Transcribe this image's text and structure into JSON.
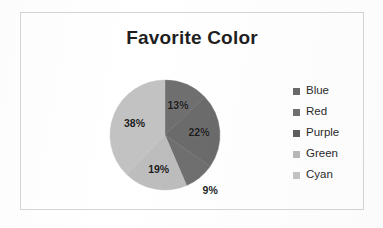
{
  "chart_data": {
    "type": "pie",
    "title": "Favorite Color",
    "categories": [
      "Blue",
      "Red",
      "Purple",
      "Green",
      "Cyan"
    ],
    "values": [
      13,
      22,
      9,
      19,
      38
    ],
    "value_labels": [
      "13%",
      "22%",
      "9%",
      "19%",
      "38%"
    ],
    "label_placement": [
      "inside",
      "inside",
      "outside",
      "inside",
      "inside"
    ],
    "slice_colors": [
      "#6f6f6f",
      "#6b6b6b",
      "#6f6f6f",
      "#bdbdbd",
      "#c2c2c2"
    ],
    "legend_swatch_colors": [
      "#6a6a6a",
      "#717171",
      "#5f5f5f",
      "#b9b9b9",
      "#c4c4c4"
    ],
    "legend_position": "right",
    "start_angle_deg": 0,
    "direction": "clockwise",
    "units": "percent",
    "grid": false,
    "xlabel": "",
    "ylabel": ""
  },
  "frame": {
    "border_color": "#d6d6d6",
    "background": "#ffffff"
  },
  "title": {
    "text": "Favorite Color",
    "color": "#1f1f1f"
  },
  "legend": {
    "items": [
      {
        "label": "Blue",
        "swatch": "#6a6a6a"
      },
      {
        "label": "Red",
        "swatch": "#717171"
      },
      {
        "label": "Purple",
        "swatch": "#5f5f5f"
      },
      {
        "label": "Green",
        "swatch": "#b9b9b9"
      },
      {
        "label": "Cyan",
        "swatch": "#c4c4c4"
      }
    ]
  },
  "labels": {
    "blue": "13%",
    "red": "22%",
    "purple": "9%",
    "green": "19%",
    "cyan": "38%"
  }
}
